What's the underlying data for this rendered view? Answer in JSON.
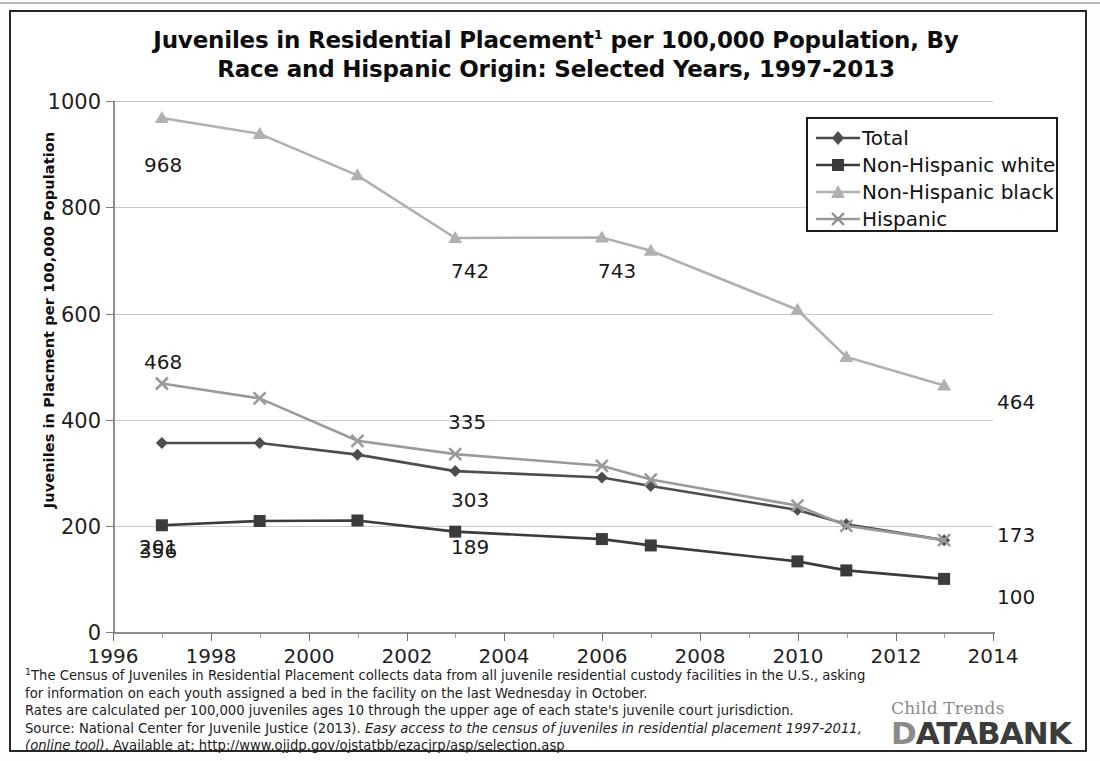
{
  "figure": {
    "title_line1": "Juveniles in Residential Placement",
    "title_sup": "1",
    "title_line1b": " per 100,000 Population, By",
    "title_line2": "Race and Hispanic Origin: Selected Years, 1997-2013"
  },
  "legend": {
    "position": "top-right",
    "items": [
      {
        "label": "Total",
        "marker": "diamond",
        "color": "#4d4d4d"
      },
      {
        "label": "Non-Hispanic white",
        "marker": "square",
        "color": "#3b3b3b"
      },
      {
        "label": "Non-Hispanic black",
        "marker": "triangle",
        "color": "#b0b0b0"
      },
      {
        "label": "Hispanic",
        "marker": "x",
        "color": "#9a9a9a"
      }
    ]
  },
  "axes": {
    "ylabel": "Juveniles in Placment per 100,000 Population",
    "xlabel": "",
    "yticks": [
      "0",
      "200",
      "400",
      "600",
      "800",
      "1000"
    ],
    "xticks": [
      "1996",
      "1998",
      "2000",
      "2002",
      "2004",
      "2006",
      "2008",
      "2010",
      "2012",
      "2014"
    ],
    "ylim": [
      0,
      1000
    ],
    "xlim": [
      1996,
      2014
    ],
    "grid": "horizontal"
  },
  "chart_data": {
    "type": "line",
    "xlabel": "",
    "ylabel": "Juveniles in Placment per 100,000 Population",
    "xlim": [
      1996,
      2014
    ],
    "ylim": [
      0,
      1000
    ],
    "grid": "horizontal gridlines every 200",
    "legend_position": "top-right",
    "x": [
      1997,
      1999,
      2001,
      2003,
      2006,
      2007,
      2010,
      2011,
      2013
    ],
    "series": [
      {
        "name": "Total",
        "marker": "diamond",
        "color": "#4d4d4d",
        "values": [
          356,
          356,
          334,
          303,
          291,
          275,
          230,
          203,
          173
        ],
        "labels": [
          {
            "x": 1997,
            "value": 356,
            "text": "356"
          },
          {
            "x": 2003,
            "value": 303,
            "text": "303"
          },
          {
            "x": 2013,
            "value": 173,
            "text": "173"
          }
        ]
      },
      {
        "name": "Non-Hispanic white",
        "marker": "square",
        "color": "#3b3b3b",
        "values": [
          201,
          209,
          210,
          189,
          175,
          163,
          133,
          116,
          100
        ],
        "labels": [
          {
            "x": 1997,
            "value": 201,
            "text": "201"
          },
          {
            "x": 2003,
            "value": 189,
            "text": "189"
          },
          {
            "x": 2013,
            "value": 100,
            "text": "100"
          }
        ]
      },
      {
        "name": "Non-Hispanic black",
        "marker": "triangle",
        "color": "#b0b0b0",
        "values": [
          968,
          938,
          860,
          742,
          743,
          718,
          607,
          518,
          464
        ],
        "labels": [
          {
            "x": 1997,
            "value": 968,
            "text": "968"
          },
          {
            "x": 2003,
            "value": 742,
            "text": "742"
          },
          {
            "x": 2006,
            "value": 743,
            "text": "743"
          },
          {
            "x": 2013,
            "value": 464,
            "text": "464"
          }
        ]
      },
      {
        "name": "Hispanic",
        "marker": "x",
        "color": "#9a9a9a",
        "values": [
          468,
          440,
          360,
          335,
          313,
          287,
          238,
          200,
          173
        ],
        "labels": [
          {
            "x": 1997,
            "value": 468,
            "text": "468"
          },
          {
            "x": 2003,
            "value": 335,
            "text": "335"
          }
        ]
      }
    ]
  },
  "notes": {
    "sup1": "1",
    "line1": "The Census of Juveniles in Residential Placement collects data from all juvenile residential custody facilities in the U.S., asking",
    "line2": "for information on each youth assigned a bed in the facility on the last Wednesday in October.",
    "line3": "Rates are calculated per 100,000 juveniles ages 10 through the upper age of each state's juvenile court jurisdiction.",
    "line4a": "Source: National Center for Juvenile Justice (2013). ",
    "line4b": "Easy access to the census of juveniles in residential placement 1997-2011,",
    "line5a": "(online tool)",
    "line5b": ". Available at: http://www.ojjdp.gov/ojstatbb/ezacjrp/asp/selection.asp"
  },
  "logo": {
    "top": "Child Trends",
    "part1": "D",
    "part2": "ATA",
    "part3": "BANK"
  }
}
